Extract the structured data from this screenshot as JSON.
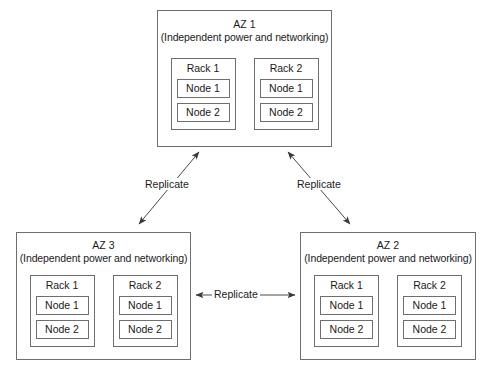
{
  "diagram": {
    "background_color": "#ffffff",
    "line_color": "#6e6e6e",
    "text_color": "#1a1a1a",
    "zones": [
      {
        "id": "az-1",
        "name": "AZ 1",
        "subtitle": "(Independent power and networking)",
        "racks": [
          {
            "label": "Rack 1",
            "nodes": [
              "Node 1",
              "Node 2"
            ]
          },
          {
            "label": "Rack 2",
            "nodes": [
              "Node 1",
              "Node 2"
            ]
          }
        ]
      },
      {
        "id": "az-3",
        "name": "AZ 3",
        "subtitle": "(Independent power and networking)",
        "racks": [
          {
            "label": "Rack 1",
            "nodes": [
              "Node 1",
              "Node 2"
            ]
          },
          {
            "label": "Rack 2",
            "nodes": [
              "Node 1",
              "Node 2"
            ]
          }
        ]
      },
      {
        "id": "az-2",
        "name": "AZ 2",
        "subtitle": "(Independent power and networking)",
        "racks": [
          {
            "label": "Rack 1",
            "nodes": [
              "Node 1",
              "Node 2"
            ]
          },
          {
            "label": "Rack 2",
            "nodes": [
              "Node 1",
              "Node 2"
            ]
          }
        ]
      }
    ],
    "connectors": [
      {
        "id": "replicate-left",
        "label": "Replicate",
        "from": "AZ 3",
        "to": "AZ 1",
        "direction": "bidirectional"
      },
      {
        "id": "replicate-right",
        "label": "Replicate",
        "from": "AZ 1",
        "to": "AZ 2",
        "direction": "bidirectional"
      },
      {
        "id": "replicate-bottom",
        "label": "Replicate",
        "from": "AZ 3",
        "to": "AZ 2",
        "direction": "bidirectional"
      }
    ]
  }
}
